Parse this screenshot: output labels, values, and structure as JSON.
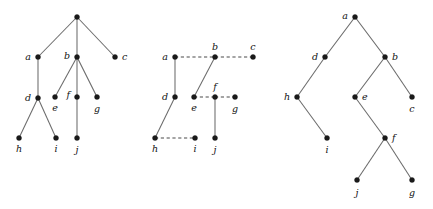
{
  "figure": {
    "width": 433,
    "height": 209,
    "background": "#ffffff",
    "node_color": "#1a1a1a",
    "solid_edge_color": "#6b6b6b",
    "dashed_edge_color": "#4a4a4a",
    "label_color": "#121212"
  },
  "trees": [
    {
      "id": "tree-left",
      "name": "unordered-tree",
      "nodes": [
        {
          "id": "root",
          "label": "",
          "x": 77,
          "y": 17,
          "label_dx": 0,
          "label_dy": 0,
          "anchor": "middle",
          "show_label": false
        },
        {
          "id": "a",
          "label": "a",
          "x": 38,
          "y": 57,
          "label_dx": -7,
          "label_dy": 3,
          "anchor": "end",
          "show_label": true
        },
        {
          "id": "b",
          "label": "b",
          "x": 77,
          "y": 57,
          "label_dx": -7,
          "label_dy": 2,
          "anchor": "end",
          "show_label": true
        },
        {
          "id": "c",
          "label": "c",
          "x": 115,
          "y": 57,
          "label_dx": 7,
          "label_dy": 3,
          "anchor": "start",
          "show_label": true
        },
        {
          "id": "d",
          "label": "d",
          "x": 38,
          "y": 98,
          "label_dx": -7,
          "label_dy": 3,
          "anchor": "end",
          "show_label": true
        },
        {
          "id": "e",
          "label": "e",
          "x": 55,
          "y": 97,
          "label_dx": 0,
          "label_dy": 14,
          "anchor": "middle",
          "show_label": true
        },
        {
          "id": "f",
          "label": "f",
          "x": 77,
          "y": 97,
          "label_dx": -7,
          "label_dy": 1,
          "anchor": "end",
          "show_label": true
        },
        {
          "id": "g",
          "label": "g",
          "x": 97,
          "y": 97,
          "label_dx": 0,
          "label_dy": 15,
          "anchor": "middle",
          "show_label": true
        },
        {
          "id": "h",
          "label": "h",
          "x": 19,
          "y": 138,
          "label_dx": 0,
          "label_dy": 14,
          "anchor": "middle",
          "show_label": true
        },
        {
          "id": "i",
          "label": "i",
          "x": 56,
          "y": 138,
          "label_dx": 0,
          "label_dy": 14,
          "anchor": "middle",
          "show_label": true
        },
        {
          "id": "j",
          "label": "j",
          "x": 77,
          "y": 138,
          "label_dx": 0,
          "label_dy": 15,
          "anchor": "middle",
          "show_label": true
        }
      ],
      "edges": [
        {
          "from": "root",
          "to": "a",
          "style": "solid"
        },
        {
          "from": "root",
          "to": "b",
          "style": "solid"
        },
        {
          "from": "root",
          "to": "c",
          "style": "solid"
        },
        {
          "from": "a",
          "to": "d",
          "style": "solid"
        },
        {
          "from": "b",
          "to": "e",
          "style": "solid"
        },
        {
          "from": "b",
          "to": "f",
          "style": "solid"
        },
        {
          "from": "b",
          "to": "g",
          "style": "solid"
        },
        {
          "from": "d",
          "to": "h",
          "style": "solid"
        },
        {
          "from": "d",
          "to": "i",
          "style": "solid"
        },
        {
          "from": "f",
          "to": "j",
          "style": "solid"
        }
      ]
    },
    {
      "id": "tree-middle",
      "name": "left-child-right-sibling-tree",
      "nodes": [
        {
          "id": "a",
          "label": "a",
          "x": 175,
          "y": 57,
          "label_dx": -7,
          "label_dy": 3,
          "anchor": "end",
          "show_label": true
        },
        {
          "id": "b",
          "label": "b",
          "x": 215,
          "y": 57,
          "label_dx": 0,
          "label_dy": -7,
          "anchor": "middle",
          "show_label": true
        },
        {
          "id": "c",
          "label": "c",
          "x": 253,
          "y": 57,
          "label_dx": 0,
          "label_dy": -7,
          "anchor": "middle",
          "show_label": true
        },
        {
          "id": "d",
          "label": "d",
          "x": 175,
          "y": 97,
          "label_dx": -7,
          "label_dy": 3,
          "anchor": "end",
          "show_label": true
        },
        {
          "id": "e",
          "label": "e",
          "x": 194,
          "y": 97,
          "label_dx": 0,
          "label_dy": 14,
          "anchor": "middle",
          "show_label": true
        },
        {
          "id": "f",
          "label": "f",
          "x": 215,
          "y": 97,
          "label_dx": 0,
          "label_dy": -7,
          "anchor": "middle",
          "show_label": true
        },
        {
          "id": "g",
          "label": "g",
          "x": 235,
          "y": 97,
          "label_dx": 0,
          "label_dy": 15,
          "anchor": "middle",
          "show_label": true
        },
        {
          "id": "h",
          "label": "h",
          "x": 155,
          "y": 138,
          "label_dx": 0,
          "label_dy": 14,
          "anchor": "middle",
          "show_label": true
        },
        {
          "id": "i",
          "label": "i",
          "x": 195,
          "y": 138,
          "label_dx": 0,
          "label_dy": 14,
          "anchor": "middle",
          "show_label": true
        },
        {
          "id": "j",
          "label": "j",
          "x": 215,
          "y": 138,
          "label_dx": 0,
          "label_dy": 15,
          "anchor": "middle",
          "show_label": true
        }
      ],
      "edges": [
        {
          "from": "a",
          "to": "b",
          "style": "dashed"
        },
        {
          "from": "b",
          "to": "c",
          "style": "dashed"
        },
        {
          "from": "a",
          "to": "d",
          "style": "solid"
        },
        {
          "from": "b",
          "to": "e",
          "style": "solid"
        },
        {
          "from": "e",
          "to": "f",
          "style": "dashed"
        },
        {
          "from": "f",
          "to": "g",
          "style": "dashed"
        },
        {
          "from": "d",
          "to": "h",
          "style": "solid"
        },
        {
          "from": "h",
          "to": "i",
          "style": "dashed"
        },
        {
          "from": "f",
          "to": "j",
          "style": "solid"
        }
      ]
    },
    {
      "id": "tree-right",
      "name": "binary-tree",
      "nodes": [
        {
          "id": "a",
          "label": "a",
          "x": 355,
          "y": 17,
          "label_dx": -7,
          "label_dy": 2,
          "anchor": "end",
          "show_label": true
        },
        {
          "id": "d",
          "label": "d",
          "x": 325,
          "y": 57,
          "label_dx": -7,
          "label_dy": 3,
          "anchor": "end",
          "show_label": true
        },
        {
          "id": "b",
          "label": "b",
          "x": 385,
          "y": 57,
          "label_dx": 7,
          "label_dy": 3,
          "anchor": "start",
          "show_label": true
        },
        {
          "id": "h",
          "label": "h",
          "x": 297,
          "y": 97,
          "label_dx": -7,
          "label_dy": 3,
          "anchor": "end",
          "show_label": true
        },
        {
          "id": "e",
          "label": "e",
          "x": 355,
          "y": 97,
          "label_dx": 7,
          "label_dy": 3,
          "anchor": "start",
          "show_label": true
        },
        {
          "id": "c",
          "label": "c",
          "x": 412,
          "y": 97,
          "label_dx": 0,
          "label_dy": 15,
          "anchor": "middle",
          "show_label": true
        },
        {
          "id": "i",
          "label": "i",
          "x": 327,
          "y": 138,
          "label_dx": 0,
          "label_dy": 15,
          "anchor": "middle",
          "show_label": true
        },
        {
          "id": "f",
          "label": "f",
          "x": 385,
          "y": 138,
          "label_dx": 7,
          "label_dy": 3,
          "anchor": "start",
          "show_label": true
        },
        {
          "id": "j",
          "label": "j",
          "x": 357,
          "y": 180,
          "label_dx": 0,
          "label_dy": 16,
          "anchor": "middle",
          "show_label": true
        },
        {
          "id": "g",
          "label": "g",
          "x": 412,
          "y": 180,
          "label_dx": 0,
          "label_dy": 16,
          "anchor": "middle",
          "show_label": true
        }
      ],
      "edges": [
        {
          "from": "a",
          "to": "d",
          "style": "solid"
        },
        {
          "from": "a",
          "to": "b",
          "style": "solid"
        },
        {
          "from": "d",
          "to": "h",
          "style": "solid"
        },
        {
          "from": "h",
          "to": "i",
          "style": "solid"
        },
        {
          "from": "b",
          "to": "e",
          "style": "solid"
        },
        {
          "from": "b",
          "to": "c",
          "style": "solid"
        },
        {
          "from": "e",
          "to": "f",
          "style": "solid"
        },
        {
          "from": "f",
          "to": "j",
          "style": "solid"
        },
        {
          "from": "f",
          "to": "g",
          "style": "solid"
        }
      ]
    }
  ]
}
